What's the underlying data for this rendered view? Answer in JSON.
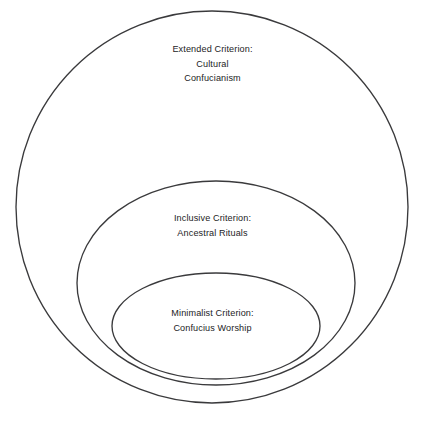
{
  "diagram": {
    "type": "nested-venn",
    "background_color": "#ffffff",
    "stroke_color": "#3a3a3c",
    "text_color": "#232325",
    "rings": [
      {
        "id": "outer",
        "shape": "circle",
        "label_lines": [
          "Extended Criterion:",
          "Cultural",
          "Confucianism"
        ],
        "criterion": "Extended Criterion",
        "concept": "Cultural Confucianism",
        "geometry": {
          "cx": 212,
          "cy": 207,
          "rx": 196,
          "ry": 196
        }
      },
      {
        "id": "middle",
        "shape": "circle",
        "label_lines": [
          "Inclusive Criterion:",
          "Ancestral Rituals"
        ],
        "criterion": "Inclusive Criterion",
        "concept": "Ancestral Rituals",
        "geometry": {
          "cx": 216,
          "cy": 283,
          "rx": 139,
          "ry": 102
        }
      },
      {
        "id": "inner",
        "shape": "ellipse",
        "label_lines": [
          "Minimalist Criterion:",
          "Confucius Worship"
        ],
        "criterion": "Minimalist Criterion",
        "concept": "Confucius Worship",
        "geometry": {
          "cx": 216,
          "cy": 326,
          "rx": 104,
          "ry": 53
        }
      }
    ]
  }
}
